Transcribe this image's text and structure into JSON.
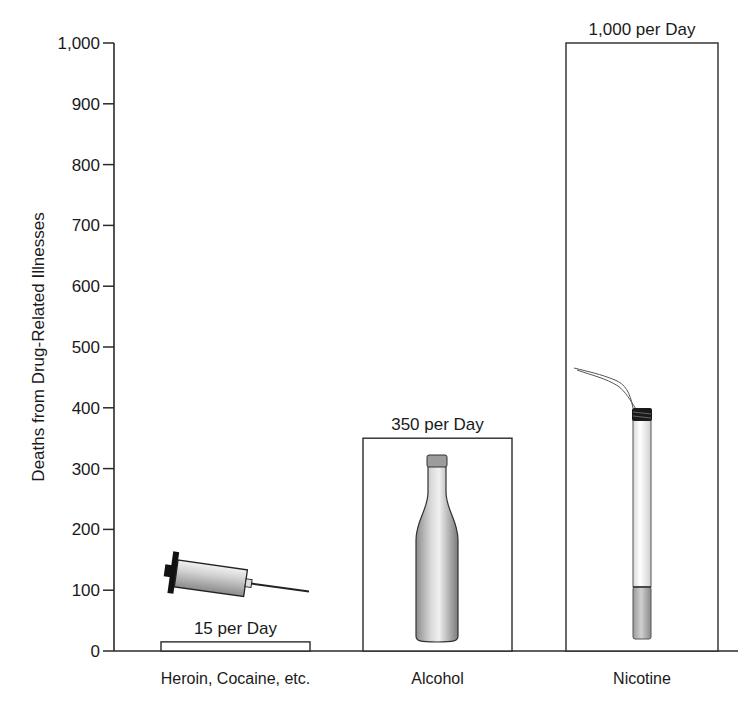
{
  "chart_data": {
    "type": "bar",
    "title": "",
    "xlabel": "",
    "ylabel": "Deaths from Drug-Related Illnesses",
    "ylim": [
      0,
      1000
    ],
    "yticks": [
      0,
      100,
      200,
      300,
      400,
      500,
      600,
      700,
      800,
      900,
      1000
    ],
    "ytick_labels": [
      "0",
      "100",
      "200",
      "300",
      "400",
      "500",
      "600",
      "700",
      "800",
      "900",
      "1,000"
    ],
    "grid": false,
    "legend": null,
    "categories": [
      "Heroin, Cocaine, etc.",
      "Alcohol",
      "Nicotine"
    ],
    "values": [
      15,
      350,
      1000
    ],
    "bar_labels": [
      "15 per Day",
      "350 per Day",
      "1,000 per Day"
    ],
    "illustrations": [
      "syringe",
      "bottle",
      "cigarette"
    ],
    "colors": {
      "bar_fill": "#ffffff",
      "bar_stroke": "#2a2a2a",
      "axis": "#2a2a2a",
      "text": "#1a1a1a"
    }
  }
}
